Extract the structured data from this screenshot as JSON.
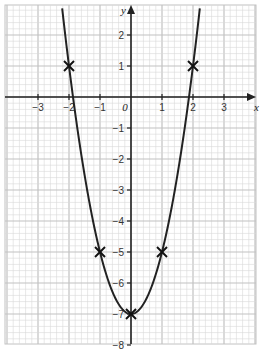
{
  "chart_data": {
    "type": "line",
    "title": "",
    "xlabel": "x",
    "ylabel": "y",
    "function": "y = 2x^2 - 7",
    "xlim": [
      -4,
      4
    ],
    "ylim": [
      -8,
      3
    ],
    "grid": true,
    "x_ticks": [
      -3,
      -2,
      -1,
      0,
      1,
      2,
      3
    ],
    "x_tick_labels": [
      "−3",
      "−2",
      "−1",
      "0",
      "1",
      "2",
      "3"
    ],
    "y_ticks": [
      2,
      1,
      -1,
      -2,
      -3,
      -4,
      -5,
      -6,
      -7,
      -8
    ],
    "y_tick_labels": [
      "2",
      "1",
      "−1",
      "−2",
      "−3",
      "−4",
      "−5",
      "−6",
      "−7",
      "−8"
    ],
    "series": [
      {
        "name": "y = 2x² − 7",
        "marked_points": [
          {
            "x": -2,
            "y": 1
          },
          {
            "x": -1,
            "y": -5
          },
          {
            "x": 0,
            "y": -7
          },
          {
            "x": 1,
            "y": -5
          },
          {
            "x": 2,
            "y": 1
          }
        ]
      }
    ],
    "colors": {
      "curve": "#222222",
      "grid_minor": "#d9d9d9",
      "grid_major": "#c2c2c2",
      "axes": "#222222"
    }
  }
}
